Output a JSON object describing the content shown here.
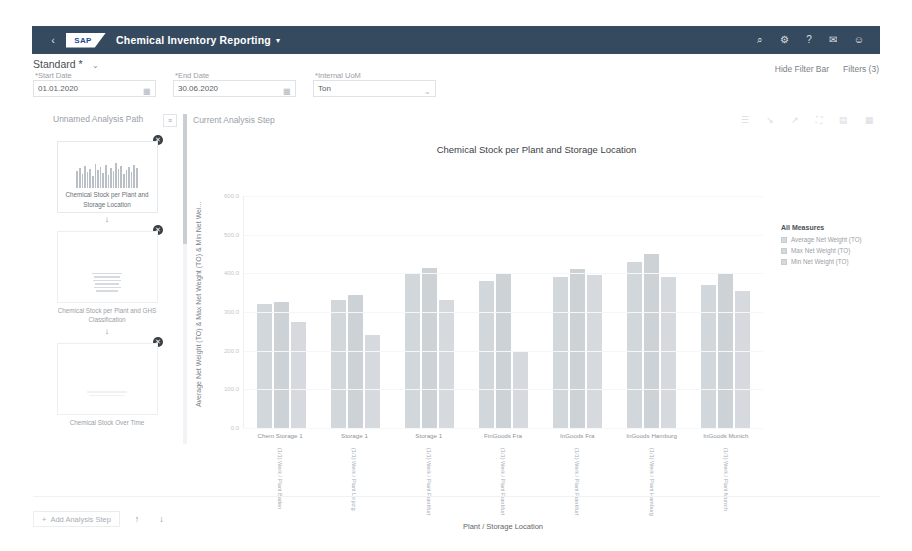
{
  "shell": {
    "back_icon": "back-arrow-icon",
    "logo_text": "SAP",
    "app_title": "Chemical Inventory Reporting",
    "title_caret": "▾",
    "icons": [
      {
        "name": "search-icon",
        "glyph": "⌕"
      },
      {
        "name": "settings-gear-icon",
        "glyph": "⚙"
      },
      {
        "name": "help-icon",
        "glyph": "?"
      },
      {
        "name": "notifications-bell-icon",
        "glyph": "✉"
      },
      {
        "name": "user-avatar-icon",
        "glyph": "☺"
      }
    ]
  },
  "variant": {
    "label": "Standard *",
    "caret": "⌄"
  },
  "filters": {
    "start_date": {
      "label": "*Start Date",
      "value": "01.01.2020",
      "icon": "calendar-icon",
      "glyph": "▦"
    },
    "end_date": {
      "label": "*End Date",
      "value": "30.06.2020",
      "icon": "calendar-icon",
      "glyph": "▦"
    },
    "uom": {
      "label": "*Internal UoM",
      "value": "Ton",
      "placeholder": "Ton",
      "icon": "chevron-down-icon",
      "glyph": "⌄"
    },
    "hide_filter_bar": "Hide Filter Bar",
    "filters_count": "Filters (3)"
  },
  "analysis_path": {
    "title": "Unnamed Analysis Path",
    "menu_icon": "overflow-menu-icon",
    "menu_glyph": "≡",
    "close_glyph": "✕",
    "arrow_glyph": "↓",
    "steps": [
      {
        "label": "Chemical Stock per Plant and Storage Location",
        "thumb": "bar-chart-thumbnail",
        "selected": true
      },
      {
        "label": "Chemical Stock per Plant and GHS Classification",
        "thumb": "table-thumbnail",
        "selected": false
      },
      {
        "label": "Chemical Stock Over Time",
        "thumb": "line-chart-thumbnail",
        "selected": false
      }
    ]
  },
  "current_step": {
    "title": "Current Analysis Step",
    "tools": [
      {
        "name": "details-icon",
        "glyph": "☰"
      },
      {
        "name": "drill-down-icon",
        "glyph": "↘"
      },
      {
        "name": "drill-up-icon",
        "glyph": "↗"
      },
      {
        "name": "fullscreen-icon",
        "glyph": "⛶"
      },
      {
        "name": "chart-type-icon",
        "glyph": "▤"
      },
      {
        "name": "legend-toggle-icon",
        "glyph": "▦"
      }
    ]
  },
  "footer": {
    "add_step_label": "Add Analysis Step",
    "add_step_plus": "+",
    "move_up_glyph": "↑",
    "move_down_glyph": "↓"
  },
  "chart_data": {
    "type": "bar",
    "title": "Chemical Stock per Plant and Storage Location",
    "xlabel": "Plant / Storage Location",
    "ylabel": "Average Net Weight (TO) & Max Net Weight (TO) & Min Net Wei...",
    "ylim": [
      0,
      600
    ],
    "yticks": [
      "600.0",
      "500.0",
      "400.0",
      "300.0",
      "200.0",
      "100.0",
      "0.0"
    ],
    "grid": true,
    "legend_position": "right",
    "legend_title": "All Measures",
    "categories": [
      "Chem Storage 1",
      "Storage 1",
      "Storage 1",
      "FinGoods Fra",
      "InGoods Fra",
      "InGoods Hamburg",
      "InGoods Munich"
    ],
    "category_sublabels": [
      "(1/1) Werk / Plant Baden",
      "(1/1) Werk / Plant Leipzig",
      "(1/1) Werk / Plant Frankfurt",
      "(1/1) Werk / Plant Frankfurt",
      "(1/1) Werk / Plant Frankfurt",
      "(1/1) Werk / Plant Hamburg",
      "(1/1) Werk / Plant Munich"
    ],
    "series": [
      {
        "name": "Average Net Weight (TO)",
        "values": [
          320,
          330,
          400,
          380,
          390,
          430,
          370
        ]
      },
      {
        "name": "Max Net Weight (TO)",
        "values": [
          325,
          345,
          415,
          400,
          410,
          450,
          400
        ]
      },
      {
        "name": "Min Net Weight (TO)",
        "values": [
          275,
          240,
          330,
          200,
          395,
          390,
          355
        ]
      }
    ]
  },
  "colors": {
    "shell_bar": "#354a5f",
    "bar_fill": "#d2d7db",
    "text_muted": "#9aa0a6"
  }
}
